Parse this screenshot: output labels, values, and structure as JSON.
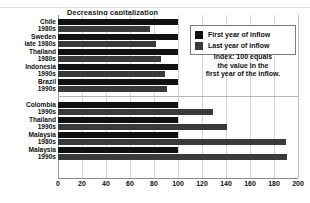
{
  "chart_data": {
    "type": "bar",
    "orientation": "horizontal",
    "title": "",
    "xlabel": "",
    "ylabel": "",
    "xlim": [
      0,
      200
    ],
    "xticks": [
      0,
      20,
      40,
      60,
      80,
      100,
      120,
      140,
      160,
      180,
      200
    ],
    "grid": true,
    "legend_position": "top-right",
    "legend": [
      "First year of inflow",
      "Last year of inflow"
    ],
    "note": [
      "Index: 100 equals",
      "the value in the",
      "first year of the inflow."
    ],
    "panels": [
      {
        "title": "Decreasing capitalization",
        "categories": [
          {
            "line1": "Chile",
            "line2": "1980s"
          },
          {
            "line1": "Sweden",
            "line2": "late 1980s"
          },
          {
            "line1": "Thailand",
            "line2": "1980s"
          },
          {
            "line1": "Indonesia",
            "line2": "1990s"
          },
          {
            "line1": "Brazil",
            "line2": "1990s"
          }
        ],
        "series": [
          {
            "name": "First year of inflow",
            "values": [
              100,
              100,
              100,
              100,
              100
            ]
          },
          {
            "name": "Last year of inflow",
            "values": [
              77,
              82,
              86,
              89,
              91
            ]
          }
        ]
      },
      {
        "title": "Increasing capitalization",
        "categories": [
          {
            "line1": "Colombia",
            "line2": "1990s"
          },
          {
            "line1": "Thailand",
            "line2": "1990s"
          },
          {
            "line1": "Malaysia",
            "line2": "1980s"
          },
          {
            "line1": "Malaysia",
            "line2": "1990s"
          }
        ],
        "series": [
          {
            "name": "First year of inflow",
            "values": [
              100,
              100,
              100,
              100
            ]
          },
          {
            "name": "Last year of inflow",
            "values": [
              129,
              141,
              190,
              191
            ]
          }
        ]
      }
    ],
    "colors": {
      "first_year": "#111111",
      "last_year": "#3a3a3a",
      "grid": "#d4d4d4",
      "axis": "#8c8c8c",
      "background": "#ffffff",
      "text": "#111111"
    }
  }
}
